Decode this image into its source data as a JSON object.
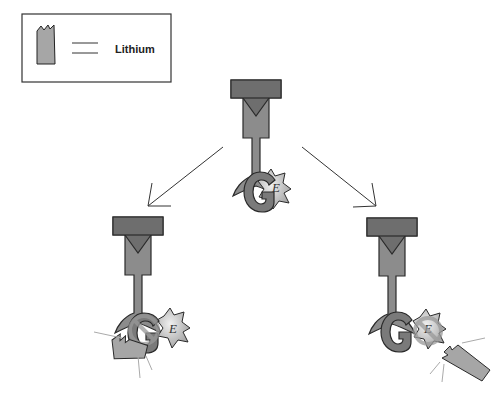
{
  "legend": {
    "symbol": "lithium-ion-block",
    "label": "Lithium"
  },
  "labels": {
    "g_protein": "G",
    "effector": "E"
  },
  "panels": [
    {
      "id": "top",
      "state": "G-protein coupled to effector"
    },
    {
      "id": "bottom-left",
      "state": "Lithium inhibits G-protein"
    },
    {
      "id": "bottom-right",
      "state": "Lithium inhibits effector"
    }
  ],
  "colors": {
    "receptor_fill": "#8c8c8c",
    "receptor_dark": "#6e6e6e",
    "g_fill": "#7a7a7a",
    "effector_fill": "#c8c8c8",
    "lithium_fill": "#a6a6a6",
    "stroke": "#2a2a2a",
    "inhibit_ring": "#999999"
  }
}
